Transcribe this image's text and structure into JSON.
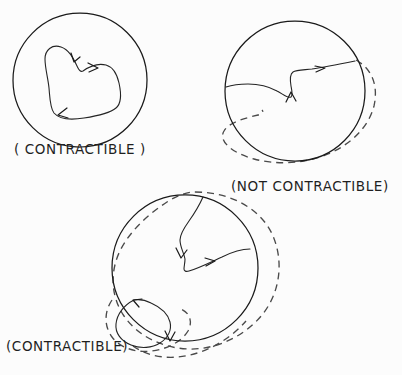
{
  "figure": {
    "background_color": "#fcfcfc",
    "ink_color": "#1a1a1a",
    "dashed_color": "#4a4a4a",
    "width": 402,
    "height": 375
  },
  "panels": [
    {
      "id": "panel-top-left",
      "caption": "( CONTRACTIBLE )",
      "region": "disk",
      "boundary": {
        "type": "circle",
        "cx": 80,
        "cy": 80,
        "r": 67,
        "style": "solid"
      },
      "loop_style": "solid",
      "arrow_count": 2,
      "has_dashed_deformation": false
    },
    {
      "id": "panel-top-right",
      "caption": "(NOT  CONTRACTIBLE)",
      "region": "disk-with-hole",
      "boundary": {
        "type": "circle",
        "cx": 295,
        "cy": 91,
        "r": 70,
        "style": "solid"
      },
      "loop_style": "solid",
      "arrow_count": 2,
      "has_dashed_deformation": true
    },
    {
      "id": "panel-bottom",
      "caption": "(CONTRACTIBLE)",
      "region": "disk",
      "boundary": {
        "type": "circle",
        "cx": 185,
        "cy": 268,
        "r": 73,
        "style": "solid"
      },
      "loop_style": "solid",
      "arrow_count": 3,
      "has_dashed_deformation": true
    }
  ],
  "captions": {
    "top_left": "( CONTRACTIBLE )",
    "top_right": "(NOT  CONTRACTIBLE)",
    "bottom": "(CONTRACTIBLE)"
  }
}
